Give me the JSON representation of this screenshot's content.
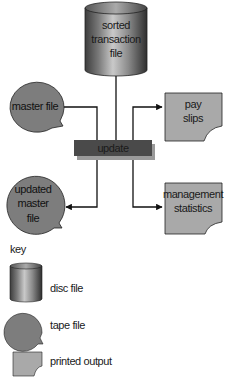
{
  "diagram": {
    "nodes": {
      "sorted_transaction_file": {
        "type": "disc",
        "lines": [
          "sorted",
          "transaction",
          "file"
        ]
      },
      "master_file": {
        "type": "tape",
        "lines": [
          "master file"
        ]
      },
      "update": {
        "type": "process",
        "label": "update"
      },
      "pay_slips": {
        "type": "printed",
        "lines": [
          "pay",
          "slips"
        ]
      },
      "updated_master_file": {
        "type": "tape",
        "lines": [
          "updated",
          "master",
          "file"
        ]
      },
      "management_statistics": {
        "type": "printed",
        "lines": [
          "management",
          "statistics"
        ]
      }
    },
    "edges": [
      {
        "from": "sorted_transaction_file",
        "to": "update"
      },
      {
        "from": "master_file",
        "to": "update"
      },
      {
        "from": "update",
        "to": "pay_slips",
        "arrow": true
      },
      {
        "from": "update",
        "to": "updated_master_file",
        "arrow": true
      },
      {
        "from": "update",
        "to": "management_statistics",
        "arrow": true
      }
    ]
  },
  "key": {
    "title": "key",
    "items": [
      {
        "symbol": "disc",
        "label": "disc file"
      },
      {
        "symbol": "tape",
        "label": "tape file"
      },
      {
        "symbol": "printed",
        "label": "printed output"
      }
    ]
  },
  "colors": {
    "tape_fill": "#7d7d7d",
    "printed_fill": "#a9a9a9",
    "process_fill": "#4a4a4a",
    "process_shadow": "#9a9a9a",
    "line": "#111111"
  }
}
